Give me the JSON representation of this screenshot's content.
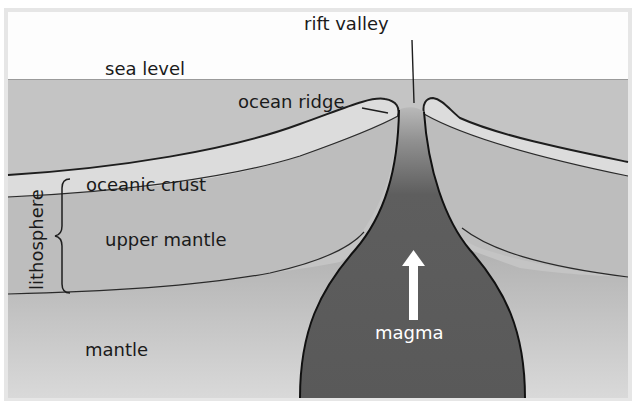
{
  "diagram": {
    "type": "cross-section",
    "labels": {
      "sea_level": "sea level",
      "rift_valley": "rift valley",
      "ocean_ridge": "ocean ridge",
      "oceanic_crust": "oceanic crust",
      "upper_mantle": "upper mantle",
      "lithosphere": "lithosphere",
      "mantle": "mantle",
      "magma": "magma"
    },
    "arrows": [
      {
        "name": "magma-rising-arrow",
        "direction": "up",
        "color": "#ffffff"
      }
    ],
    "colors": {
      "sky": "#fdfdfd",
      "sea": "#c4c4c4",
      "crust": "#dcdcdc",
      "upper_mantle": "#bdbdbd",
      "mantle_top": "#b0b0b0",
      "mantle_bottom": "#d6d6d6",
      "magma": "#5b5b5b",
      "outline": "#1e1e1e",
      "frame": "#e4e4e4"
    }
  }
}
